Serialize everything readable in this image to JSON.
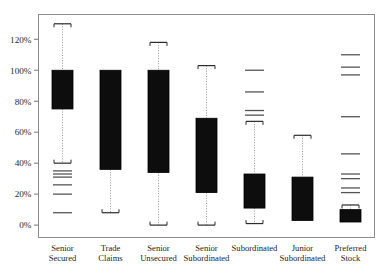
{
  "chart_data": {
    "type": "box",
    "title": "",
    "xlabel": "",
    "ylabel": "",
    "ylim": [
      -8,
      136
    ],
    "yticks": [
      0,
      20,
      40,
      60,
      80,
      100,
      120
    ],
    "ytick_labels": [
      "0%",
      "20%",
      "40%",
      "60%",
      "80%",
      "100%",
      "120%"
    ],
    "grid": false,
    "legend": "none",
    "categories": [
      "Senior Secured",
      "Trade Claims",
      "Senior Unsecured",
      "Senior Subordinated",
      "Subordinated",
      "Junior Subordinated",
      "Preferred Stock"
    ],
    "category_lines": [
      [
        "Senior",
        "Secured"
      ],
      [
        "Trade",
        "Claims"
      ],
      [
        "Senior",
        "Unsecured"
      ],
      [
        "Senior",
        "Subordinated"
      ],
      [
        "Subordinated",
        ""
      ],
      [
        "Junior",
        "Subordinated"
      ],
      [
        "Preferred",
        "Stock"
      ]
    ],
    "boxes": [
      {
        "category": "Senior Secured",
        "whisker_high": 130,
        "q3": 100,
        "q1": 75,
        "whisker_low": 40,
        "outliers": [
          35,
          33,
          31,
          26,
          20,
          8
        ]
      },
      {
        "category": "Trade Claims",
        "whisker_high": 100,
        "q3": 100,
        "q1": 36,
        "whisker_low": 8,
        "outliers": []
      },
      {
        "category": "Senior Unsecured",
        "whisker_high": 118,
        "q3": 100,
        "q1": 34,
        "whisker_low": 0,
        "outliers": []
      },
      {
        "category": "Senior Subordinated",
        "whisker_high": 103,
        "q3": 69,
        "q1": 21,
        "whisker_low": 0,
        "outliers": []
      },
      {
        "category": "Subordinated",
        "whisker_high": 67,
        "q3": 33,
        "q1": 11,
        "whisker_low": 1,
        "outliers": [
          100,
          86,
          74,
          71
        ]
      },
      {
        "category": "Junior Subordinated",
        "whisker_high": 58,
        "q3": 31,
        "q1": 3,
        "whisker_low": 3,
        "outliers": []
      },
      {
        "category": "Preferred Stock",
        "whisker_high": 13,
        "q3": 10,
        "q1": 2,
        "whisker_low": 2,
        "outliers": [
          110,
          102,
          97,
          70,
          46,
          33,
          30,
          24,
          21
        ]
      }
    ],
    "colors": {
      "box_fill": "#0d0d0d",
      "box_edge": "#000000",
      "whisker": "#9a9a9a",
      "cap": "#2b2b2b",
      "outlier": "#555555",
      "axis": "#777777",
      "frame": "#8c8c8c",
      "background": "#ffffff"
    }
  }
}
